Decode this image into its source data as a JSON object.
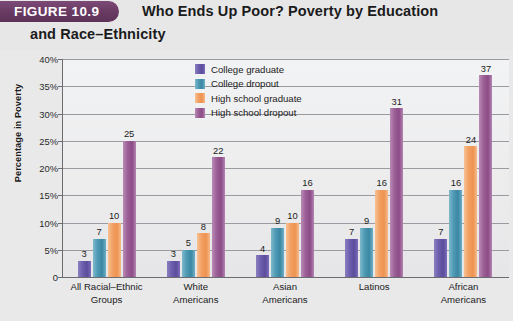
{
  "header": {
    "badge": "FIGURE 10.9",
    "title_line1": "Who Ends Up Poor? Poverty by Education",
    "title_line2": "and Race–Ethnicity"
  },
  "chart_data": {
    "type": "bar",
    "title": "Who Ends Up Poor? Poverty by Education and Race–Ethnicity",
    "xlabel": "",
    "ylabel": "Percentage in Poverty",
    "ylim": [
      0,
      40
    ],
    "ytick_labels": [
      "40%",
      "35%",
      "30%",
      "25%",
      "20%",
      "15%",
      "10%",
      "5%",
      "0"
    ],
    "ytick_values": [
      40,
      35,
      30,
      25,
      20,
      15,
      10,
      5,
      0
    ],
    "grid": true,
    "legend_position": "top-center",
    "categories": [
      "All Racial–Ethnic Groups",
      "White Americans",
      "Asian Americans",
      "Latinos",
      "African Americans"
    ],
    "category_lines": [
      [
        "All Racial–Ethnic",
        "Groups"
      ],
      [
        "White",
        "Americans"
      ],
      [
        "Asian",
        "Americans"
      ],
      [
        "Latinos",
        ""
      ],
      [
        "African",
        "Americans"
      ]
    ],
    "series": [
      {
        "name": "College graduate",
        "color": "#5b4c9c",
        "values": [
          3,
          3,
          4,
          7,
          7
        ]
      },
      {
        "name": "College dropout",
        "color": "#3b87a3",
        "values": [
          7,
          5,
          9,
          9,
          16
        ]
      },
      {
        "name": "High school graduate",
        "color": "#ee9350",
        "values": [
          10,
          8,
          10,
          16,
          24
        ]
      },
      {
        "name": "High school dropout",
        "color": "#8c4c86",
        "values": [
          25,
          22,
          16,
          31,
          37
        ]
      }
    ]
  },
  "colors": {
    "badge": "#6a3b64",
    "page_background": "#e9e9ea",
    "plot_background": "#ececed",
    "axis": "#6b6b70",
    "gridline": "#9a9aa0"
  }
}
